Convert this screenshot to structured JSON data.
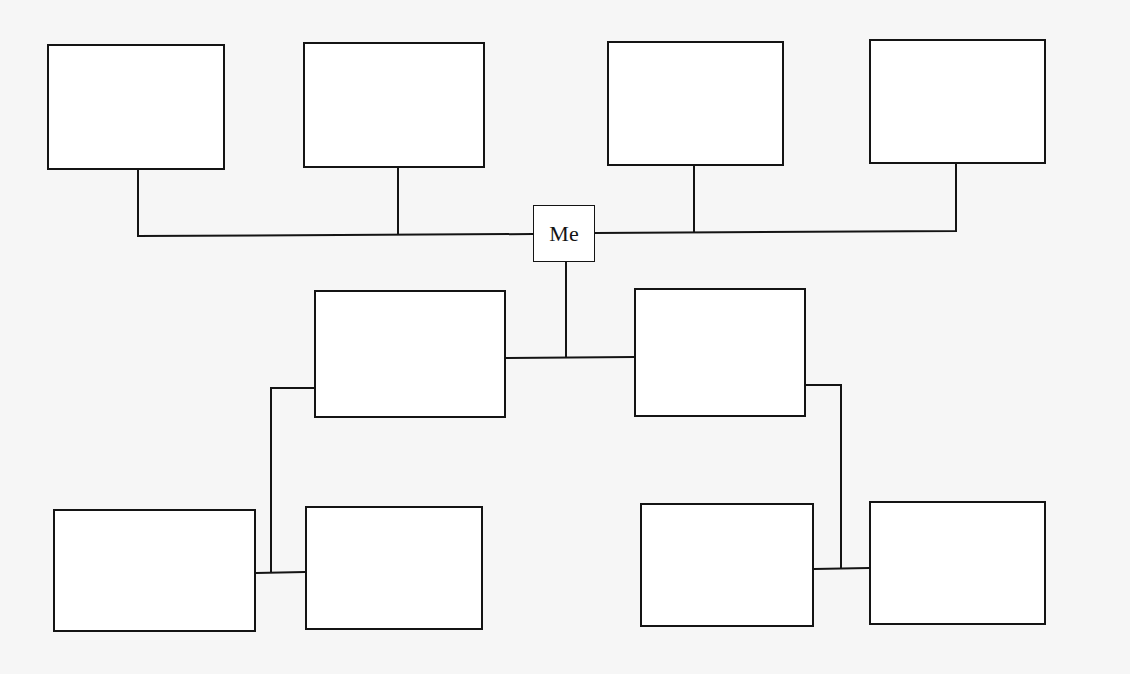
{
  "diagram": {
    "type": "family-tree",
    "center": {
      "id": "me",
      "label": "Me"
    },
    "colors": {
      "line": "#141414",
      "box_fill": "#ffffff",
      "background": "#f6f6f6"
    },
    "nodes": [
      {
        "id": "grandparent-1",
        "label": "",
        "x": 47,
        "y": 44,
        "w": 178,
        "h": 126
      },
      {
        "id": "grandparent-2",
        "label": "",
        "x": 303,
        "y": 42,
        "w": 182,
        "h": 126
      },
      {
        "id": "grandparent-3",
        "label": "",
        "x": 607,
        "y": 41,
        "w": 177,
        "h": 125
      },
      {
        "id": "grandparent-4",
        "label": "",
        "x": 869,
        "y": 39,
        "w": 177,
        "h": 125
      },
      {
        "id": "me",
        "label": "Me",
        "x": 533,
        "y": 205,
        "w": 62,
        "h": 57
      },
      {
        "id": "child-1",
        "label": "",
        "x": 314,
        "y": 290,
        "w": 192,
        "h": 128
      },
      {
        "id": "child-2",
        "label": "",
        "x": 634,
        "y": 288,
        "w": 172,
        "h": 129
      },
      {
        "id": "grandchild-1",
        "label": "",
        "x": 53,
        "y": 509,
        "w": 203,
        "h": 123
      },
      {
        "id": "grandchild-2",
        "label": "",
        "x": 305,
        "y": 506,
        "w": 178,
        "h": 124
      },
      {
        "id": "grandchild-3",
        "label": "",
        "x": 640,
        "y": 503,
        "w": 174,
        "h": 124
      },
      {
        "id": "grandchild-4",
        "label": "",
        "x": 869,
        "y": 501,
        "w": 177,
        "h": 124
      }
    ],
    "connectors": [
      "M138,170 L138,236 L533,234",
      "M398,168 L398,235",
      "M595,233 L956,231 L956,164",
      "M694,166 L694,232",
      "M566,262 L566,357",
      "M506,358 L634,357",
      "M314,388 L271,388 L271,572",
      "M256,573 L305,572",
      "M806,385 L841,385 L841,568",
      "M814,569 L869,568"
    ]
  }
}
